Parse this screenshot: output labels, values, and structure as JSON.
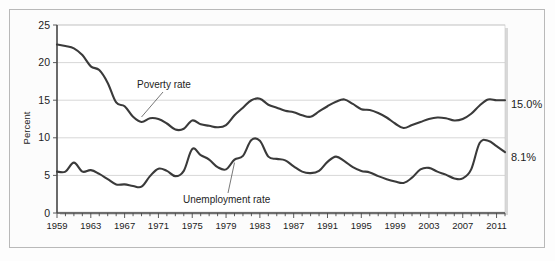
{
  "figure": {
    "outer_frame": true,
    "panel_background": "#ffffff",
    "line_color": "#3a3a3a",
    "grid_color": "#c6c6c6"
  },
  "annotations": {
    "poverty_label": "Poverty rate",
    "unemployment_label": "Unemployment rate",
    "poverty_end_value_label": "15.0%",
    "unemployment_end_value_label": "8.1%"
  },
  "chart_data": {
    "type": "line",
    "title": "",
    "subtitle": "",
    "xlabel": "",
    "ylabel": "Percent",
    "xlim": [
      1959,
      2012
    ],
    "ylim": [
      0,
      25
    ],
    "yticks": [
      0,
      5,
      10,
      15,
      20,
      25
    ],
    "ytick_labels": [
      "0",
      "5",
      "10",
      "15",
      "20",
      "25"
    ],
    "xtick_labels": [
      "1959",
      "1963",
      "1967",
      "1971",
      "1975",
      "1979",
      "1983",
      "1987",
      "1991",
      "1995",
      "1999",
      "2003",
      "2007",
      "2011"
    ],
    "xtick_label_years": [
      1959,
      1963,
      1967,
      1971,
      1975,
      1979,
      1983,
      1987,
      1991,
      1995,
      1999,
      2003,
      2007,
      2011
    ],
    "minor_tick_interval": 1,
    "grid": "horizontal",
    "legend": "inline-annotations",
    "x": [
      1959,
      1960,
      1961,
      1962,
      1963,
      1964,
      1965,
      1966,
      1967,
      1968,
      1969,
      1970,
      1971,
      1972,
      1973,
      1974,
      1975,
      1976,
      1977,
      1978,
      1979,
      1980,
      1981,
      1982,
      1983,
      1984,
      1985,
      1986,
      1987,
      1988,
      1989,
      1990,
      1991,
      1992,
      1993,
      1994,
      1995,
      1996,
      1997,
      1998,
      1999,
      2000,
      2001,
      2002,
      2003,
      2004,
      2005,
      2006,
      2007,
      2008,
      2009,
      2010,
      2011,
      2012
    ],
    "series": [
      {
        "name": "Poverty rate",
        "end_value": 15.0,
        "values": [
          22.4,
          22.2,
          21.9,
          21.0,
          19.5,
          19.0,
          17.3,
          14.7,
          14.2,
          12.8,
          12.1,
          12.6,
          12.5,
          11.9,
          11.1,
          11.2,
          12.3,
          11.8,
          11.6,
          11.4,
          11.7,
          13.0,
          14.0,
          15.0,
          15.2,
          14.4,
          14.0,
          13.6,
          13.4,
          13.0,
          12.8,
          13.5,
          14.2,
          14.8,
          15.1,
          14.5,
          13.8,
          13.7,
          13.3,
          12.7,
          11.9,
          11.3,
          11.7,
          12.1,
          12.5,
          12.7,
          12.6,
          12.3,
          12.5,
          13.2,
          14.3,
          15.1,
          15.0,
          15.0
        ]
      },
      {
        "name": "Unemployment rate",
        "end_value": 8.1,
        "values": [
          5.5,
          5.5,
          6.7,
          5.5,
          5.7,
          5.2,
          4.5,
          3.8,
          3.8,
          3.6,
          3.5,
          4.9,
          5.9,
          5.6,
          4.9,
          5.6,
          8.5,
          7.7,
          7.1,
          6.1,
          5.8,
          7.1,
          7.6,
          9.7,
          9.6,
          7.5,
          7.2,
          7.0,
          6.2,
          5.5,
          5.3,
          5.6,
          6.8,
          7.5,
          6.9,
          6.1,
          5.6,
          5.4,
          4.9,
          4.5,
          4.2,
          4.0,
          4.7,
          5.8,
          6.0,
          5.5,
          5.1,
          4.6,
          4.6,
          5.8,
          9.3,
          9.6,
          8.9,
          8.1
        ]
      }
    ]
  }
}
